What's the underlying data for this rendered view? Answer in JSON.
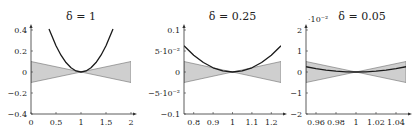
{
  "figure": {
    "background": "#ffffff",
    "colors": {
      "band_fill": "#cfcfcf",
      "band_stroke": "#6e6e6e",
      "curve": "#1a1a1a",
      "axis": "#333333"
    }
  },
  "chart_data": [
    {
      "type": "area",
      "title": "δ = 1",
      "xlabel": "",
      "ylabel": "",
      "xlim": [
        0,
        2
      ],
      "ylim": [
        -0.4,
        0.4
      ],
      "x_ticks": [
        0,
        0.5,
        1,
        1.5,
        2
      ],
      "x_tick_labels": [
        "0",
        "0.5",
        "1",
        "1.5",
        "2"
      ],
      "y_ticks": [
        -0.4,
        -0.2,
        0,
        0.2,
        0.4
      ],
      "y_tick_labels": [
        "−0.4",
        "−0.2",
        "0",
        "0.2",
        "0.4"
      ],
      "y_exponent_label": "",
      "grid": false,
      "series": [
        {
          "name": "curve",
          "kind": "line",
          "x": [
            0.36,
            0.5,
            0.6,
            0.7,
            0.8,
            0.9,
            1.0,
            1.1,
            1.2,
            1.3,
            1.4,
            1.5,
            1.64
          ],
          "y": [
            0.41,
            0.25,
            0.16,
            0.09,
            0.04,
            0.01,
            0.0,
            0.01,
            0.04,
            0.09,
            0.16,
            0.25,
            0.41
          ]
        },
        {
          "name": "band_upper",
          "kind": "band",
          "x": [
            0,
            1,
            2
          ],
          "y": [
            0.1,
            0,
            0.1
          ]
        },
        {
          "name": "band_lower",
          "kind": "band",
          "x": [
            0,
            1,
            2
          ],
          "y": [
            -0.1,
            0,
            -0.1
          ]
        }
      ],
      "frame": {
        "x0": 31,
        "x1": 131,
        "y0": 30,
        "y1": 114
      }
    },
    {
      "type": "area",
      "title": "δ = 0.25",
      "xlabel": "",
      "ylabel": "",
      "xlim": [
        0.75,
        1.25
      ],
      "ylim": [
        -0.1,
        0.1
      ],
      "x_ticks": [
        0.8,
        0.9,
        1,
        1.1,
        1.2
      ],
      "x_tick_labels": [
        "0.8",
        "0.9",
        "1",
        "1.1",
        "1.2"
      ],
      "y_ticks": [
        -0.1,
        -0.05,
        0,
        0.05,
        0.1
      ],
      "y_tick_labels": [
        "−0.1",
        "−5·10⁻²",
        "0",
        "5·10⁻²",
        "0.1"
      ],
      "y_exponent_label": "",
      "grid": false,
      "series": [
        {
          "name": "curve",
          "kind": "line",
          "x": [
            0.75,
            0.8,
            0.85,
            0.9,
            0.95,
            1.0,
            1.05,
            1.1,
            1.15,
            1.2,
            1.25
          ],
          "y": [
            0.0625,
            0.04,
            0.0225,
            0.01,
            0.0025,
            0.0,
            0.0025,
            0.01,
            0.0225,
            0.04,
            0.0625
          ]
        },
        {
          "name": "band_upper",
          "kind": "band",
          "x": [
            0.75,
            1,
            1.25
          ],
          "y": [
            0.025,
            0,
            0.025
          ]
        },
        {
          "name": "band_lower",
          "kind": "band",
          "x": [
            0.75,
            1,
            1.25
          ],
          "y": [
            -0.025,
            0,
            -0.025
          ]
        }
      ],
      "frame": {
        "x0": 184,
        "x1": 281,
        "y0": 30,
        "y1": 114
      }
    },
    {
      "type": "area",
      "title": "δ = 0.05",
      "xlabel": "",
      "ylabel": "",
      "xlim": [
        0.95,
        1.05
      ],
      "ylim": [
        -0.02,
        0.02
      ],
      "x_ticks": [
        0.96,
        0.98,
        1,
        1.02,
        1.04
      ],
      "x_tick_labels": [
        "0.96",
        "0.98",
        "1",
        "1.02",
        "1.04"
      ],
      "y_ticks": [
        -0.02,
        -0.01,
        0,
        0.01,
        0.02
      ],
      "y_tick_labels": [
        "−2",
        "−1",
        "0",
        "1",
        "2"
      ],
      "y_exponent_label": "·10⁻²",
      "grid": false,
      "series": [
        {
          "name": "curve",
          "kind": "line",
          "x": [
            0.95,
            0.96,
            0.97,
            0.98,
            0.99,
            1.0,
            1.01,
            1.02,
            1.03,
            1.04,
            1.05
          ],
          "y": [
            0.0025,
            0.0016,
            0.0009,
            0.0004,
            0.0001,
            0.0,
            0.0001,
            0.0004,
            0.0009,
            0.0016,
            0.0025
          ]
        },
        {
          "name": "band_upper",
          "kind": "band",
          "x": [
            0.95,
            1,
            1.05
          ],
          "y": [
            0.005,
            0,
            0.005
          ]
        },
        {
          "name": "band_lower",
          "kind": "band",
          "x": [
            0.95,
            1,
            1.05
          ],
          "y": [
            -0.005,
            0,
            -0.005
          ]
        }
      ],
      "frame": {
        "x0": 306,
        "x1": 406,
        "y0": 30,
        "y1": 114
      }
    }
  ]
}
